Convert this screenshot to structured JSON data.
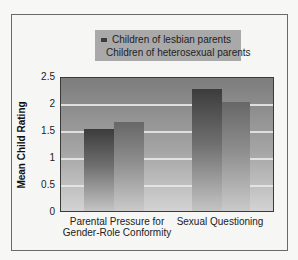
{
  "chart_data": {
    "type": "bar",
    "title": "",
    "xlabel": "",
    "ylabel": "Mean Child Rating",
    "ylim": [
      0,
      2.5
    ],
    "yticks": [
      "0",
      "0.5",
      "1",
      "1.5",
      "2",
      "2.5"
    ],
    "categories": [
      "Parental Pressure for Gender-Role Conformity",
      "Sexual Questioning"
    ],
    "category_lines": [
      [
        "Parental Pressure for",
        "Gender-Role Conformity"
      ],
      [
        "Sexual Questioning"
      ]
    ],
    "series": [
      {
        "name": "Children of lesbian parents",
        "values": [
          1.55,
          2.3
        ],
        "color": "#3c3c3c"
      },
      {
        "name": "Children of heterosexual parents",
        "values": [
          1.67,
          2.05
        ],
        "color": "#6e6e6e"
      }
    ],
    "grid": true,
    "legend_position": "top"
  },
  "legend": {
    "items": [
      {
        "label": "Children of lesbian parents",
        "color": "#3c3c3c"
      },
      {
        "label": "Children of heterosexual parents",
        "color": "#6e6e6e"
      }
    ]
  }
}
